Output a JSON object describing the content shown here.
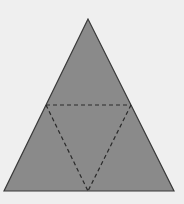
{
  "diagram": {
    "type": "net-of-tetrahedron",
    "background_color": "#efefef",
    "outer_triangle": {
      "points": [
        [
          88,
          19
        ],
        [
          4,
          191
        ],
        [
          174,
          191
        ]
      ],
      "fill": "#8a8a8a",
      "stroke": "#3a3a3a"
    },
    "fold_lines": {
      "style": "dashed",
      "color": "#2a2a2a",
      "segments": [
        {
          "from": [
            46,
            105
          ],
          "to": [
            131,
            105
          ]
        },
        {
          "from": [
            46,
            105
          ],
          "to": [
            88,
            191
          ]
        },
        {
          "from": [
            131,
            105
          ],
          "to": [
            88,
            191
          ]
        }
      ]
    }
  }
}
